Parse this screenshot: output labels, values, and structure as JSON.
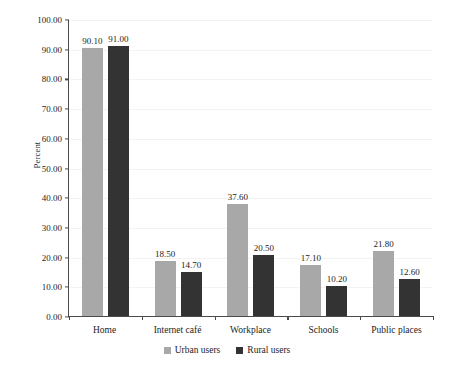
{
  "chart_data": {
    "type": "bar",
    "title": "",
    "subtitle": "",
    "xlabel": "",
    "ylabel": "Percent",
    "categories": [
      "Home",
      "Internet café",
      "Workplace",
      "Schools",
      "Public places"
    ],
    "series": [
      {
        "name": "Urban users",
        "color": "#a8a8a8",
        "values": [
          90.1,
          18.5,
          37.6,
          17.1,
          21.8
        ],
        "labels": [
          "90.10",
          "18.50",
          "37.60",
          "17.10",
          "21.80"
        ]
      },
      {
        "name": "Rural users",
        "color": "#333333",
        "values": [
          91.0,
          14.7,
          20.5,
          10.2,
          12.6
        ],
        "labels": [
          "91.00",
          "14.70",
          "20.50",
          "10.20",
          "12.60"
        ]
      }
    ],
    "ylim": [
      0,
      100
    ],
    "ytick_step": 10,
    "ytick_labels": [
      "100.00",
      "90.00",
      "80.00",
      "70.00",
      "60.00",
      "50.00",
      "40.00",
      "30.00",
      "20.00",
      "10.00",
      "0.00"
    ],
    "ytick_values": [
      100,
      90,
      80,
      70,
      60,
      50,
      40,
      30,
      20,
      10,
      0
    ],
    "grid": true,
    "legend_position": "bottom-center",
    "data_labels": true
  },
  "axis": {
    "y_title": "Percent"
  },
  "legend": {
    "items": [
      {
        "label": "Urban users",
        "color": "#a8a8a8"
      },
      {
        "label": "Rural users",
        "color": "#333333"
      }
    ]
  },
  "colors": {
    "urban": "#a8a8a8",
    "rural": "#333333",
    "axis": "#4a4a4a",
    "grid": "#f3f3f3",
    "background": "#ffffff",
    "text": "#1d1d1d"
  }
}
